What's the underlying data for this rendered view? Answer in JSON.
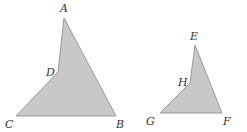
{
  "diagram": {
    "fill_color": "#c8c8c8",
    "stroke_color": "#9a9a9a",
    "shapes": [
      {
        "name": "quadrilateral-ABCD",
        "vertices": [
          {
            "label": "A",
            "x": 64,
            "y": 18,
            "lx": 60,
            "ly": 12
          },
          {
            "label": "B",
            "x": 116,
            "y": 116,
            "lx": 116,
            "ly": 128
          },
          {
            "label": "C",
            "x": 16,
            "y": 116,
            "lx": 5,
            "ly": 128
          },
          {
            "label": "D",
            "x": 58,
            "y": 72,
            "lx": 46,
            "ly": 76
          }
        ]
      },
      {
        "name": "quadrilateral-EFGH",
        "vertices": [
          {
            "label": "E",
            "x": 195,
            "y": 45,
            "lx": 190,
            "ly": 40
          },
          {
            "label": "F",
            "x": 222,
            "y": 113,
            "lx": 223,
            "ly": 125
          },
          {
            "label": "G",
            "x": 160,
            "y": 113,
            "lx": 146,
            "ly": 125
          },
          {
            "label": "H",
            "x": 190,
            "y": 83,
            "lx": 178,
            "ly": 86
          }
        ]
      }
    ]
  }
}
